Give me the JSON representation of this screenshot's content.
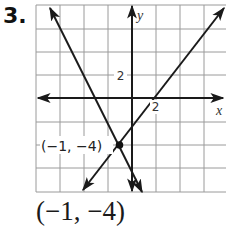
{
  "problem": {
    "number": "3.",
    "answer": "(−1, −4)"
  },
  "graph": {
    "axis_labels": {
      "x": "x",
      "y": "y"
    },
    "tick_labels": {
      "x": "2",
      "y": "2"
    },
    "grid_units_per_cell": 2,
    "x_range": [
      -8,
      8
    ],
    "y_range": [
      -8,
      8
    ],
    "point": {
      "label": "(−1, −4)",
      "x": -1,
      "y": -4
    },
    "lines": [
      {
        "name": "line-1",
        "equation": "y = -2x - 6",
        "slope": -2,
        "intercept": -6
      },
      {
        "name": "line-2",
        "equation": "y = (4/3)x - 8/3",
        "slope": 1.3333,
        "intercept": -2.6667
      }
    ],
    "colors": {
      "grid": "#9a9a9a",
      "axis": "#1a1a1a",
      "line": "#1a1a1a",
      "background": "#ffffff"
    }
  }
}
